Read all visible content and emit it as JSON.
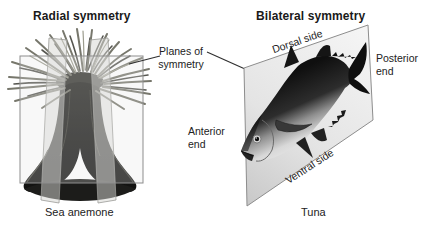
{
  "figure": {
    "left_panel": {
      "title": "Radial symmetry",
      "caption": "Sea anemone"
    },
    "center": {
      "planes_label": [
        "Planes of",
        "symmetry"
      ]
    },
    "right_panel": {
      "title": "Bilateral symmetry",
      "caption": "Tuna",
      "dorsal_label": "Dorsal side",
      "ventral_label": "Ventral side",
      "anterior_label": [
        "Anterior",
        "end"
      ],
      "posterior_label": [
        "Posterior",
        "end"
      ]
    }
  },
  "colors": {
    "background": "#ffffff",
    "text": "#1a1a1a",
    "plane_fill_light": "#f5f5f5",
    "plane_fill_dark": "#cccccc",
    "plane_border": "#8d8d8d",
    "pointer_line": "#2e2e2e",
    "fish_back": "#121212",
    "fish_belly": "#efefef",
    "anemone_body": "#1b1b19",
    "anemone_tentacle": "#77776c"
  }
}
